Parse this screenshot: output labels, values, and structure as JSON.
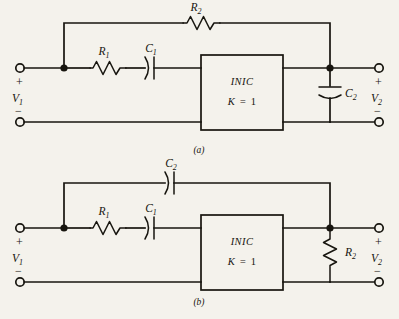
{
  "figure": {
    "type": "circuit-schematic",
    "background_color": "#f4f2ec",
    "ink_color": "#17150f"
  },
  "circuits": [
    {
      "id": "a",
      "caption": "(a)",
      "input_port": {
        "label": "V",
        "subscript": "1",
        "plus": "+",
        "minus": "−"
      },
      "output_port": {
        "label": "V",
        "subscript": "2",
        "plus": "+",
        "minus": "−"
      },
      "block": {
        "name": "INIC",
        "gain_label": "K",
        "gain_equals": "=",
        "gain_value": "1"
      },
      "components": [
        {
          "name": "R",
          "subscript": "2",
          "kind": "resistor",
          "orientation": "horizontal",
          "position": "feedback-top"
        },
        {
          "name": "R",
          "subscript": "1",
          "kind": "resistor",
          "orientation": "horizontal",
          "position": "series-input"
        },
        {
          "name": "C",
          "subscript": "1",
          "kind": "capacitor",
          "orientation": "horizontal",
          "position": "series-input"
        },
        {
          "name": "C",
          "subscript": "2",
          "kind": "capacitor",
          "orientation": "vertical",
          "position": "shunt-output"
        }
      ]
    },
    {
      "id": "b",
      "caption": "(b)",
      "input_port": {
        "label": "V",
        "subscript": "1",
        "plus": "+",
        "minus": "−"
      },
      "output_port": {
        "label": "V",
        "subscript": "2",
        "plus": "+",
        "minus": "−"
      },
      "block": {
        "name": "INIC",
        "gain_label": "K",
        "gain_equals": "=",
        "gain_value": "1"
      },
      "components": [
        {
          "name": "C",
          "subscript": "2",
          "kind": "capacitor",
          "orientation": "horizontal",
          "position": "feedback-top"
        },
        {
          "name": "R",
          "subscript": "1",
          "kind": "resistor",
          "orientation": "horizontal",
          "position": "series-input"
        },
        {
          "name": "C",
          "subscript": "1",
          "kind": "capacitor",
          "orientation": "horizontal",
          "position": "series-input"
        },
        {
          "name": "R",
          "subscript": "2",
          "kind": "resistor",
          "orientation": "vertical",
          "position": "shunt-output"
        }
      ]
    }
  ]
}
